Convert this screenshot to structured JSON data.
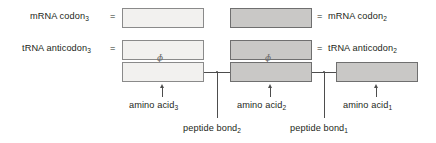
{
  "diagram": {
    "colors": {
      "box_light_fill": "#f2f1ef",
      "box_shaded_fill": "#c9c8c6",
      "box_border": "#8a8a8a",
      "line": "#4d4d4d",
      "text": "#231f20",
      "background": "#ffffff"
    },
    "left_labels": [
      {
        "id": "mrna-codon-3",
        "text": "mRNA codon",
        "subscript": "3",
        "equals": "="
      },
      {
        "id": "trna-anticodon-3",
        "text": "tRNA anticodon",
        "subscript": "3",
        "equals": "="
      }
    ],
    "right_labels": [
      {
        "id": "mrna-codon-2",
        "text": "mRNA codon",
        "subscript": "2",
        "equals": "="
      },
      {
        "id": "trna-anticodon-2",
        "text": "tRNA anticodon",
        "subscript": "2",
        "equals": "="
      }
    ],
    "boxes": [
      {
        "id": "mrna-codon-3-box",
        "shaded": false,
        "row": "codon",
        "column": "left"
      },
      {
        "id": "mrna-codon-2-box",
        "shaded": true,
        "row": "codon",
        "column": "middle"
      },
      {
        "id": "trna-anticodon-3-box",
        "shaded": false,
        "row": "anticodon",
        "column": "left"
      },
      {
        "id": "trna-anticodon-2-box",
        "shaded": true,
        "row": "anticodon",
        "column": "middle"
      },
      {
        "id": "amino-acid-3-box",
        "shaded": false,
        "row": "amino-acid",
        "column": "left"
      },
      {
        "id": "amino-acid-2-box",
        "shaded": true,
        "row": "amino-acid",
        "column": "middle"
      },
      {
        "id": "amino-acid-1-box",
        "shaded": true,
        "row": "amino-acid",
        "column": "right"
      }
    ],
    "bottom_labels": [
      {
        "id": "amino-acid-3",
        "text": "amino acid",
        "subscript": "3"
      },
      {
        "id": "amino-acid-2",
        "text": "amino acid",
        "subscript": "2"
      },
      {
        "id": "amino-acid-1",
        "text": "amino acid",
        "subscript": "1"
      }
    ],
    "bond_labels": [
      {
        "id": "peptide-bond-2",
        "text": "peptide bond",
        "subscript": "2"
      },
      {
        "id": "peptide-bond-1",
        "text": "peptide bond",
        "subscript": "1"
      }
    ],
    "squiggle_glyph": "ɸ"
  }
}
